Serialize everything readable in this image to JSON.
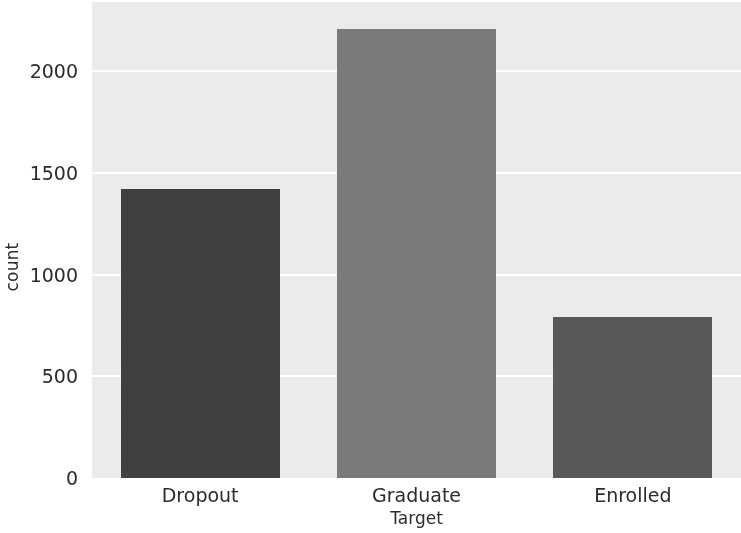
{
  "chart_data": {
    "type": "bar",
    "title": "",
    "subtitle": "",
    "xlabel": "Target",
    "ylabel": "count",
    "categories": [
      "Dropout",
      "Graduate",
      "Enrolled"
    ],
    "values": [
      1421,
      2209,
      794
    ],
    "series": [
      {
        "name": "count",
        "values": [
          1421,
          2209,
          794
        ]
      }
    ],
    "bar_colors": [
      "#3f3f3f",
      "#7a7a7a",
      "#585858"
    ],
    "ylim": [
      0,
      2340
    ],
    "xlim_categories": 3,
    "yticks": [
      0,
      500,
      1000,
      1500,
      2000
    ],
    "ytick_labels": [
      "0",
      "500",
      "1000",
      "1500",
      "2000"
    ],
    "xtick_labels": [
      "Dropout",
      "Graduate",
      "Enrolled"
    ],
    "grid": true,
    "grid_axis": "y",
    "grid_color": "#ffffff",
    "legend": null,
    "legend_position": "none",
    "plot_background": "#ebebeb",
    "figure_background": "#ffffff",
    "tick_label_color": "#2b2b2b",
    "annotations": []
  },
  "axes": {
    "y_axis_label": "count",
    "x_axis_label": "Target"
  }
}
